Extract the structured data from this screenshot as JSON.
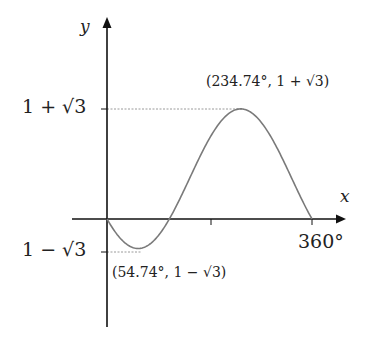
{
  "diagram": {
    "title": "",
    "function": "f(x) = 1 - √3·cos(x - 54.74°)",
    "axes": {
      "x_label": "x",
      "y_label": "y",
      "x_tick_label_end": "360°"
    },
    "y_ticks": {
      "upper": "1 + √3",
      "lower": "1 − √3"
    },
    "points": {
      "max": {
        "label": "(234.74°, 1 + √3)",
        "x_deg": 234.74,
        "y": 2.732
      },
      "min": {
        "label": "(54.74°, 1 − √3)",
        "x_deg": 54.74,
        "y": -0.732
      }
    },
    "colors": {
      "axis": "#111111",
      "curve": "#7a7a7a",
      "guide": "#9a9a9a",
      "text": "#222222"
    }
  },
  "chart_data": {
    "type": "line",
    "title": "",
    "xlabel": "x",
    "ylabel": "y",
    "x_range_deg": [
      0,
      360
    ],
    "x_ticks": [
      180,
      360
    ],
    "x_tick_labels": [
      "",
      "360°"
    ],
    "y_tick_labels": [
      "1 + √3",
      "1 − √3"
    ],
    "y_ticks": [
      2.732,
      -0.732
    ],
    "series": [
      {
        "name": "y = 1 - √3 cos(x - 54.74°)",
        "x": [
          0,
          54.74,
          144.74,
          234.74,
          324.74,
          360
        ],
        "values": [
          0,
          -0.732,
          1,
          2.732,
          1,
          0
        ]
      }
    ],
    "annotations": [
      {
        "text": "(234.74°, 1 + √3)",
        "x": 234.74,
        "y": 2.732,
        "kind": "maximum"
      },
      {
        "text": "(54.74°, 1 − √3)",
        "x": 54.74,
        "y": -0.732,
        "kind": "minimum"
      }
    ],
    "grid": false,
    "legend": null
  }
}
